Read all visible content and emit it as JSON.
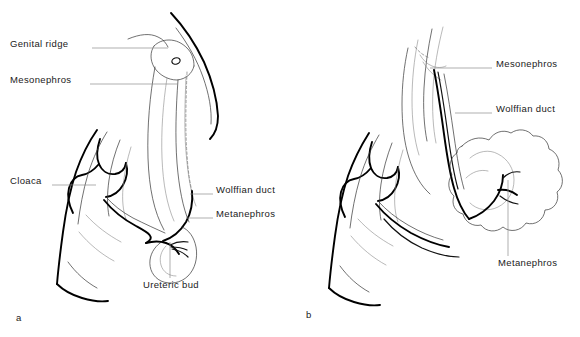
{
  "figure": {
    "background_color": "#ffffff",
    "ink_color": "#000000",
    "panels": [
      {
        "letter": "a",
        "caption": "a",
        "stage": "early",
        "labels": [
          {
            "id": "genital-ridge",
            "text": "Genital ridge",
            "side": "left",
            "x": 10,
            "y": 44,
            "leader_from_x": 92,
            "leader_from_y": 48,
            "leader_to_x": 168,
            "leader_to_y": 48
          },
          {
            "id": "mesonephros",
            "text": "Mesonephros",
            "side": "left",
            "x": 10,
            "y": 80,
            "leader_from_x": 90,
            "leader_from_y": 84,
            "leader_to_x": 178,
            "leader_to_y": 84
          },
          {
            "id": "cloaca",
            "text": "Cloaca",
            "side": "left",
            "x": 10,
            "y": 181,
            "leader_from_x": 52,
            "leader_from_y": 185,
            "leader_to_x": 96,
            "leader_to_y": 185
          },
          {
            "id": "wolffian-duct",
            "text": "Wolffian duct",
            "side": "right",
            "x": 216,
            "y": 190,
            "leader_from_x": 190,
            "leader_from_y": 194,
            "leader_to_x": 213,
            "leader_to_y": 194
          },
          {
            "id": "metanephros",
            "text": "Metanephros",
            "side": "right",
            "x": 216,
            "y": 214,
            "leader_from_x": 186,
            "leader_from_y": 218,
            "leader_to_x": 213,
            "leader_to_y": 218
          },
          {
            "id": "ureteric-bud",
            "text": "Ureteric bud",
            "side": "below",
            "x": 143,
            "y": 285,
            "leader_from_x": 170,
            "leader_from_y": 242,
            "leader_to_x": 170,
            "leader_to_y": 278
          }
        ]
      },
      {
        "letter": "b",
        "caption": "b",
        "stage": "late",
        "labels": [
          {
            "id": "mesonephros-b",
            "text": "Mesonephros",
            "side": "right",
            "x": 496,
            "y": 64,
            "leader_from_x": 430,
            "leader_from_y": 68,
            "leader_to_x": 492,
            "leader_to_y": 68
          },
          {
            "id": "wolffian-duct-b",
            "text": "Wolffian duct",
            "side": "right",
            "x": 496,
            "y": 109,
            "leader_from_x": 455,
            "leader_from_y": 113,
            "leader_to_x": 492,
            "leader_to_y": 113
          },
          {
            "id": "metanephros-b",
            "text": "Metanephros",
            "side": "below",
            "x": 498,
            "y": 263,
            "leader_from_x": 508,
            "leader_from_y": 180,
            "leader_to_x": 508,
            "leader_to_y": 256
          }
        ]
      }
    ]
  }
}
